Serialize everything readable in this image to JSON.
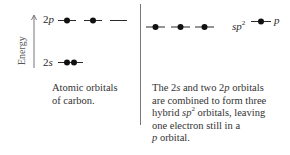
{
  "axis": {
    "label": "Energy",
    "direction": "up"
  },
  "left_panel": {
    "levels": [
      {
        "label_num": "2",
        "label_orb": "p",
        "orbitals": [
          {
            "electrons": 1
          },
          {
            "electrons": 1
          },
          {
            "electrons": 0
          }
        ]
      },
      {
        "label_num": "2",
        "label_orb": "s",
        "orbitals": [
          {
            "electrons": 2
          }
        ]
      }
    ],
    "caption_line1": "Atomic orbitals",
    "caption_line2": "of carbon."
  },
  "right_panel": {
    "sp2_label_base": "sp",
    "sp2_label_sup": "2",
    "p_label": "p",
    "orbitals_sp2": [
      {
        "electrons": 1
      },
      {
        "electrons": 1
      },
      {
        "electrons": 1
      }
    ],
    "orbital_p": {
      "electrons": 1
    },
    "caption": {
      "l1_a": "The 2",
      "l1_s": "s",
      "l1_b": " and two 2",
      "l1_p": "p",
      "l1_c": " orbitals",
      "l2": "are combined to form three",
      "l3_a": "hybrid ",
      "l3_sp": "sp",
      "l3_sup": "2",
      "l3_b": " orbitals, leaving",
      "l4": "one electron still in a",
      "l5_p": "p",
      "l5_b": " orbital."
    }
  },
  "colors": {
    "line": "#2a2a2a",
    "electron": "#111111",
    "divider": "#777777"
  }
}
